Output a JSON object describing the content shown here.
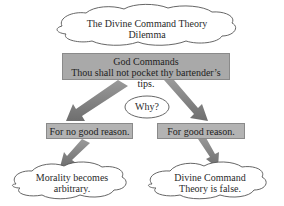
{
  "diagram": {
    "title_cloud": {
      "line1": "The Divine Command Theory",
      "line2": "Dilemma"
    },
    "command_box": {
      "heading": "God Commands",
      "text": "Thou shall not pocket thy bartender’s tips."
    },
    "question_oval": {
      "text": "Why?"
    },
    "branches": [
      {
        "label": "For no good reason.",
        "outcome": {
          "line1": "Morality becomes",
          "line2": "arbitrary."
        }
      },
      {
        "label": "For good reason.",
        "outcome": {
          "line1": "Divine Command",
          "line2": "Theory is false."
        }
      }
    ],
    "colors": {
      "box_fill": "#a9a9a9",
      "arrow_fill": "#7a7a7a",
      "cloud_stroke": "#555555",
      "background": "#ffffff"
    }
  }
}
